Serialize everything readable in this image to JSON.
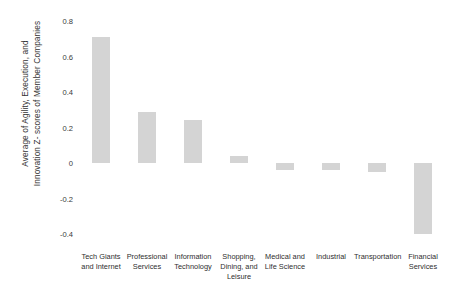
{
  "chart_data": {
    "type": "bar",
    "title": "",
    "xlabel": "",
    "ylabel": "Average of Agility, Execution, and Innovation Z- scores of Member Companies",
    "ylabel_lines": [
      "Average of Agility, Execution, and",
      "Innovation Z- scores of Member Companies"
    ],
    "categories": [
      "Tech Giants and Internet",
      "Professional Services",
      "Information Technology",
      "Shopping, Dining, and Leisure",
      "Medical and Life Science",
      "Industrial",
      "Transportation",
      "Financial Services"
    ],
    "category_label_lines": [
      [
        "Tech Giants",
        "and Internet"
      ],
      [
        "Professional",
        "Services"
      ],
      [
        "Information",
        "Technology"
      ],
      [
        "Shopping,",
        "Dining, and",
        "Leisure"
      ],
      [
        "Medical and",
        "Life Science"
      ],
      [
        "Industrial"
      ],
      [
        "Transportation"
      ],
      [
        "Financial",
        "Services"
      ]
    ],
    "values": [
      0.71,
      0.29,
      0.24,
      0.04,
      -0.04,
      -0.04,
      -0.05,
      -0.4
    ],
    "ylim": [
      -0.4,
      0.8
    ],
    "yticks": [
      0.8,
      0.6,
      0.4,
      0.2,
      0,
      -0.2,
      -0.4
    ],
    "ytick_labels": [
      "0.8",
      "0.6",
      "0.4",
      "0.2",
      "0",
      "-0.2",
      "-0.4"
    ],
    "grid": false,
    "legend": false,
    "bar_color": "#d4d4d4",
    "background_color": "#ffffff"
  }
}
